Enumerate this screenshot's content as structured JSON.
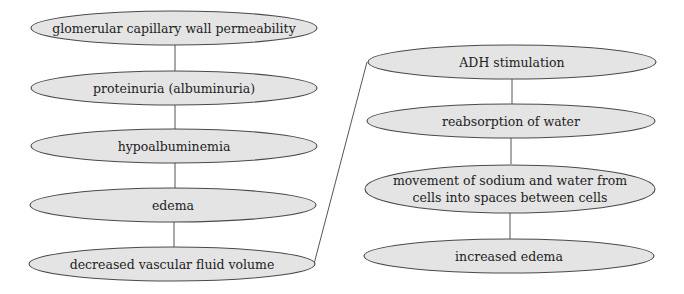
{
  "diagram": {
    "type": "flowchart",
    "colors": {
      "node_fill": "#e4e4e4",
      "node_stroke": "#4a4a4a",
      "edge": "#555555",
      "text": "#222222"
    },
    "left_column": [
      {
        "id": "n1",
        "label": "glomerular capillary wall permeability"
      },
      {
        "id": "n2",
        "label": "proteinuria (albuminuria)"
      },
      {
        "id": "n3",
        "label": "hypoalbuminemia"
      },
      {
        "id": "n4",
        "label": "edema"
      },
      {
        "id": "n5",
        "label": "decreased vascular fluid volume"
      }
    ],
    "right_column": [
      {
        "id": "n6",
        "label": "ADH stimulation"
      },
      {
        "id": "n7",
        "label": "reabsorption of water"
      },
      {
        "id": "n8",
        "label_line1": "movement of sodium and water from",
        "label_line2": "cells into spaces between cells"
      },
      {
        "id": "n9",
        "label": "increased edema"
      }
    ],
    "edges": [
      [
        "n1",
        "n2"
      ],
      [
        "n2",
        "n3"
      ],
      [
        "n3",
        "n4"
      ],
      [
        "n4",
        "n5"
      ],
      [
        "n5",
        "n6"
      ],
      [
        "n6",
        "n7"
      ],
      [
        "n7",
        "n8"
      ],
      [
        "n8",
        "n9"
      ]
    ]
  }
}
